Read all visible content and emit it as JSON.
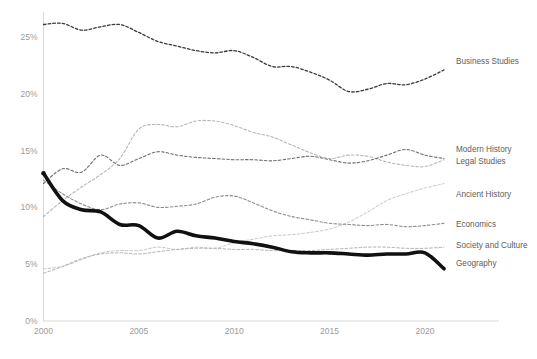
{
  "chart_data": {
    "type": "line",
    "title": "",
    "subtitle": "",
    "xlabel": "",
    "ylabel": "",
    "xlim": [
      2000,
      2021
    ],
    "ylim": [
      0,
      27
    ],
    "xticks": [
      "2000",
      "2005",
      "2010",
      "2015",
      "2020"
    ],
    "xtick_values": [
      2000,
      2005,
      2010,
      2015,
      2020
    ],
    "yticks": [
      "0%",
      "5%",
      "10%",
      "15%",
      "20%",
      "25%"
    ],
    "ytick_values": [
      0,
      5,
      10,
      15,
      20,
      25
    ],
    "grid": false,
    "legend_position": "right-inline-labels",
    "x": [
      2000,
      2001,
      2002,
      2003,
      2004,
      2005,
      2006,
      2007,
      2008,
      2009,
      2010,
      2011,
      2012,
      2013,
      2014,
      2015,
      2016,
      2017,
      2018,
      2019,
      2020,
      2021
    ],
    "series": [
      {
        "name": "Business Studies",
        "style": "dashed",
        "color": "#3a3a3a",
        "width": 1.3,
        "label_y_pct": 22.9,
        "values": [
          26.1,
          26.2,
          25.6,
          25.9,
          26.1,
          25.4,
          24.6,
          24.2,
          23.8,
          23.6,
          23.8,
          23.2,
          22.4,
          22.4,
          21.9,
          21.2,
          20.2,
          20.4,
          20.9,
          20.8,
          21.3,
          22.1
        ]
      },
      {
        "name": "Modern History",
        "style": "dashed",
        "color": "#b6b6b6",
        "width": 1.1,
        "label_y_pct": 15.1,
        "values": [
          9.2,
          10.6,
          11.8,
          12.9,
          14.3,
          16.9,
          17.3,
          17.1,
          17.6,
          17.6,
          17.2,
          16.6,
          16.2,
          15.5,
          14.8,
          14.3,
          14.6,
          14.5,
          14.0,
          13.7,
          13.6,
          14.2
        ]
      },
      {
        "name": "Legal Studies",
        "style": "dashed",
        "color": "#6e6e6e",
        "width": 1.1,
        "label_y_pct": 14.1,
        "values": [
          12.1,
          13.4,
          13.1,
          14.6,
          13.7,
          14.3,
          14.9,
          14.6,
          14.4,
          14.3,
          14.2,
          14.2,
          14.1,
          14.3,
          14.5,
          14.2,
          13.9,
          14.1,
          14.6,
          15.1,
          14.6,
          14.3
        ]
      },
      {
        "name": "Ancient History",
        "style": "dashed",
        "color": "#c6c6c6",
        "width": 1.0,
        "label_y_pct": 11.2,
        "values": [
          4.6,
          4.8,
          5.4,
          6.0,
          6.2,
          6.2,
          6.5,
          6.3,
          6.5,
          6.4,
          6.9,
          7.2,
          7.5,
          7.6,
          7.8,
          8.1,
          8.7,
          9.6,
          10.6,
          11.2,
          11.7,
          12.1
        ]
      },
      {
        "name": "Economics",
        "style": "dashed",
        "color": "#8c8c8c",
        "width": 1.1,
        "label_y_pct": 8.5,
        "values": [
          12.4,
          11.2,
          10.3,
          9.8,
          10.3,
          10.4,
          10.0,
          10.1,
          10.3,
          10.9,
          11.0,
          10.4,
          9.7,
          9.2,
          8.9,
          8.6,
          8.5,
          8.4,
          8.5,
          8.3,
          8.4,
          8.6
        ]
      },
      {
        "name": "Society and Culture",
        "style": "dashed",
        "color": "#b0b0b0",
        "width": 1.0,
        "label_y_pct": 6.7,
        "values": [
          4.2,
          4.8,
          5.5,
          5.9,
          6.0,
          5.9,
          6.1,
          6.3,
          6.4,
          6.4,
          6.3,
          6.3,
          6.2,
          6.2,
          6.2,
          6.3,
          6.4,
          6.5,
          6.5,
          6.4,
          6.4,
          6.5
        ]
      },
      {
        "name": "Geography",
        "style": "solid",
        "color": "#111111",
        "width": 3.6,
        "label_y_pct": 5.1,
        "highlight": true,
        "values": [
          13.0,
          10.6,
          9.8,
          9.6,
          8.5,
          8.4,
          7.3,
          7.9,
          7.5,
          7.3,
          7.0,
          6.8,
          6.5,
          6.1,
          6.0,
          6.0,
          5.9,
          5.8,
          5.9,
          5.9,
          6.0,
          4.6
        ]
      }
    ]
  },
  "axis": {
    "x_axis_name": "year-axis",
    "y_axis_name": "percent-axis"
  },
  "caption": ""
}
